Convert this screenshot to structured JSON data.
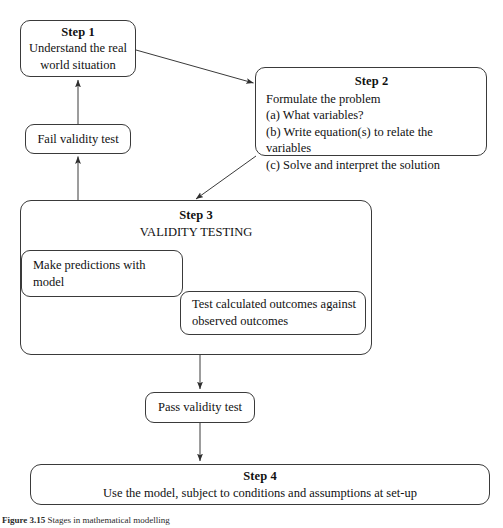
{
  "figure": {
    "caption_label": "Figure 3.15",
    "caption_text": "Stages in mathematical modelling"
  },
  "nodes": {
    "step1": {
      "title": "Step 1",
      "line1": "Understand the real",
      "line2": "world situation"
    },
    "step2": {
      "title": "Step 2",
      "line1": "Formulate the problem",
      "line2": "(a) What variables?",
      "line3": "(b) Write equation(s) to relate the variables",
      "line4": "(c) Solve and interpret the solution"
    },
    "fail_validity": {
      "label": "Fail validity test"
    },
    "step3": {
      "title": "Step 3",
      "subtitle": "VALIDITY TESTING",
      "predictions": {
        "label": "Make predictions with model"
      },
      "test_outcomes": {
        "line1": "Test calculated outcomes against",
        "line2": "observed outcomes"
      }
    },
    "pass_validity": {
      "label": "Pass validity test"
    },
    "step4": {
      "title": "Step 4",
      "line1": "Use the model, subject to conditions and assumptions at set-up"
    }
  },
  "connectors": [
    {
      "id": "step1-to-step2",
      "from": "step1",
      "to": "step2",
      "kind": "diagonal-arrow"
    },
    {
      "id": "step2-to-step3",
      "from": "step2",
      "to": "step3",
      "kind": "diagonal-arrow"
    },
    {
      "id": "step3-to-fail",
      "from": "step3",
      "to": "fail_validity",
      "kind": "vertical-arrow-up"
    },
    {
      "id": "fail-to-step1",
      "from": "fail_validity",
      "to": "step1",
      "kind": "vertical-arrow-up"
    },
    {
      "id": "step3-to-pass",
      "from": "step3",
      "to": "pass_validity",
      "kind": "vertical-arrow-down"
    },
    {
      "id": "pass-to-step4",
      "from": "pass_validity",
      "to": "step4",
      "kind": "vertical-arrow-down"
    }
  ],
  "style": {
    "stroke": "#3a3a3a",
    "background": "#ffffff",
    "text": "#111111"
  }
}
